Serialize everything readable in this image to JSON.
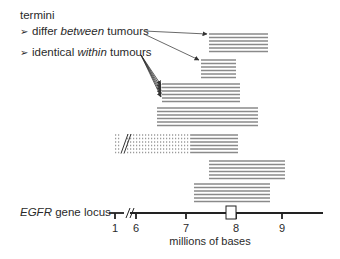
{
  "legend": {
    "heading": "termini",
    "items": [
      {
        "bullet": "➢",
        "prefix": "differ ",
        "emphasis": "between",
        "suffix": " tumours"
      },
      {
        "bullet": "➢",
        "prefix": "identical ",
        "emphasis": "within",
        "suffix": " tumours"
      }
    ]
  },
  "axis": {
    "gene_name": "EGFR",
    "gene_label_suffix": " gene locus",
    "unit_label": "millions of bases",
    "ticks": [
      {
        "label": "1",
        "x": 115
      },
      {
        "label": "6",
        "x": 136
      },
      {
        "label": "7",
        "x": 186
      },
      {
        "label": "8",
        "x": 236
      },
      {
        "label": "9",
        "x": 282
      }
    ],
    "break_mark": "//",
    "gene_box": {
      "start_x": 226,
      "end_x": 236
    }
  },
  "colors": {
    "line": "#222222",
    "bars": "#8a8a8a",
    "dotted": "#9a9a9a"
  },
  "blocks": [
    {
      "id": 1,
      "x1": 209,
      "x2": 268,
      "y": 34,
      "lines": 6,
      "group": "differ-between"
    },
    {
      "id": 2,
      "x1": 201,
      "x2": 236,
      "y": 60,
      "lines": 6,
      "group": "differ-between"
    },
    {
      "id": 3,
      "x1": 162,
      "x2": 240,
      "y": 84,
      "lines": 6,
      "group": "identical-within"
    },
    {
      "id": 4,
      "x1": 157,
      "x2": 258,
      "y": 108,
      "lines": 6,
      "group": "none"
    },
    {
      "id": 5,
      "x1": 115,
      "x2": 238,
      "y": 135,
      "lines": 6,
      "group": "none",
      "dotted_until": 191,
      "has_break": true
    },
    {
      "id": 6,
      "x1": 209,
      "x2": 285,
      "y": 161,
      "lines": 6,
      "group": "none"
    },
    {
      "id": 7,
      "x1": 194,
      "x2": 270,
      "y": 184,
      "lines": 6,
      "group": "none"
    }
  ]
}
